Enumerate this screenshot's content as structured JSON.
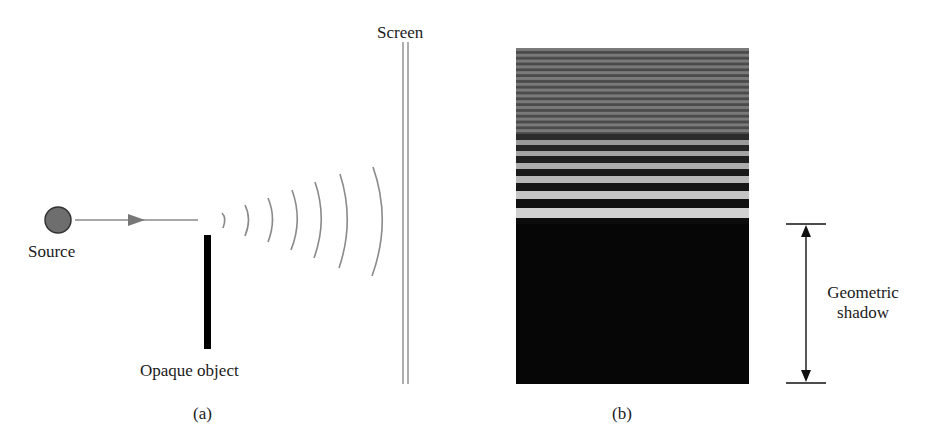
{
  "panel_a": {
    "caption": "(a)",
    "source_label": "Source",
    "object_label": "Opaque object",
    "screen_label": "Screen",
    "wavefront_count": 7
  },
  "panel_b": {
    "caption": "(b)",
    "shadow_label_line1": "Geometric",
    "shadow_label_line2": "shadow",
    "fringe_bands": [
      {
        "top": 0,
        "height": 160,
        "color": "#6a6a6a",
        "pattern": "fine"
      },
      {
        "top": 86,
        "height": 6,
        "color": "#2c2c2c"
      },
      {
        "top": 92,
        "height": 5,
        "color": "#9a9a9a"
      },
      {
        "top": 97,
        "height": 6,
        "color": "#262626"
      },
      {
        "top": 103,
        "height": 5,
        "color": "#a4a4a4"
      },
      {
        "top": 108,
        "height": 7,
        "color": "#202020"
      },
      {
        "top": 115,
        "height": 6,
        "color": "#acacac"
      },
      {
        "top": 121,
        "height": 7,
        "color": "#1a1a1a"
      },
      {
        "top": 128,
        "height": 7,
        "color": "#b8b8b8"
      },
      {
        "top": 135,
        "height": 8,
        "color": "#161616"
      },
      {
        "top": 143,
        "height": 8,
        "color": "#c4c4c4"
      },
      {
        "top": 151,
        "height": 9,
        "color": "#101010"
      },
      {
        "top": 160,
        "height": 10,
        "color": "#d0d0d0"
      },
      {
        "top": 170,
        "height": 11,
        "color": "#0c0c0c"
      },
      {
        "top": 181,
        "height": 11,
        "color": "#e2e2e2"
      },
      {
        "top": 192,
        "height": 1,
        "color": "#9a9a9a"
      },
      {
        "top": 193,
        "height": 13,
        "color": "#080808"
      },
      {
        "top": 157,
        "height": 0,
        "color": "#000000"
      }
    ]
  },
  "colors": {
    "wave_line": "#8a8a8a",
    "source_fill": "#6e6e6e",
    "object_fill": "#000000",
    "screen_line": "#9a9a9a",
    "arrow": "#222222"
  }
}
